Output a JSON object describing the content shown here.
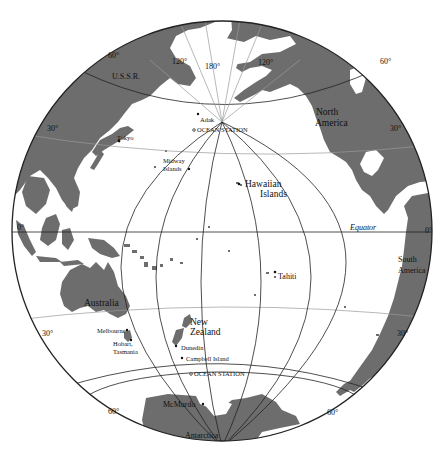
{
  "map": {
    "projection": "orthographic globe centered on the Pacific Ocean",
    "colors": {
      "land": "#6d6d6d",
      "ocean": "#ffffff",
      "lines": "#222222"
    },
    "meridian_labels": [
      "120°",
      "180°",
      "120°"
    ],
    "latitude_labels": {
      "north_60_left": "60°",
      "north_60_right": "60°",
      "north_30_left": "30°",
      "north_30_right": "30°",
      "equator_left": "0°",
      "equator_right": "0°",
      "south_30_left": "30°",
      "south_30_right": "30°",
      "south_60_left": "60°",
      "south_60_right": "60°"
    },
    "equator_label": "Equator",
    "regions": {
      "ussr": "U.S.S.R.",
      "north_america_1": "North",
      "north_america_2": "America",
      "south_america_1": "South",
      "south_america_2": "America",
      "australia": "Australia",
      "new_zealand_1": "New",
      "new_zealand_2": "Zealand",
      "antarctica": "Antarctica",
      "hawaiian_1": "Hawaiian",
      "hawaiian_2": "Islands"
    },
    "places": {
      "tokyo": "Tokyo",
      "adak": "Adak",
      "ocean_station_north": "OCEAN STATION",
      "midway_1": "Midway",
      "midway_2": "Islands",
      "tahiti": "Tahiti",
      "melbourne": "Melbourne",
      "hobart_1": "Hobart,",
      "hobart_2": "Tasmania",
      "dunedin": "Dunedin",
      "campbell": "Campbell Island",
      "ocean_station_south": "OCEAN STATION",
      "mcmurdo": "McMurdo"
    }
  }
}
